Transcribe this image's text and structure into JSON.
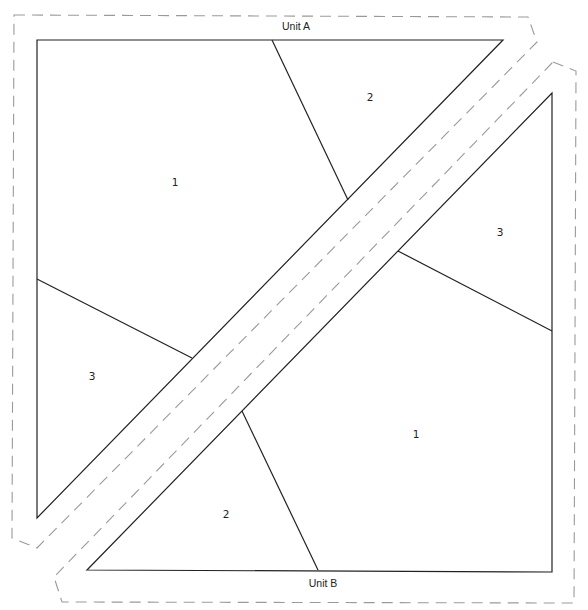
{
  "diagram": {
    "type": "foundation paper piecing pattern",
    "units": [
      {
        "name": "Unit A",
        "label_pos": [
          296,
          30
        ],
        "outline": [
          [
            37,
            40
          ],
          [
            503,
            40
          ],
          [
            37,
            518
          ]
        ],
        "seam_allowance": [
          [
            14,
            15
          ],
          [
            528,
            17
          ],
          [
            537,
            42
          ],
          [
            37,
            548
          ],
          [
            12,
            538
          ]
        ],
        "piece_lines": [
          [
            [
              272,
              40
            ],
            [
              348,
              200
            ]
          ],
          [
            [
              37,
              279
            ],
            [
              192,
              358
            ]
          ]
        ],
        "pieces": [
          {
            "number": "1",
            "pos": [
              175,
              185
            ]
          },
          {
            "number": "2",
            "pos": [
              370,
              100
            ]
          },
          {
            "number": "3",
            "pos": [
              92,
              379
            ]
          }
        ]
      },
      {
        "name": "Unit B",
        "label_pos": [
          323,
          586
        ],
        "outline": [
          [
            552,
            93
          ],
          [
            552,
            572
          ],
          [
            87,
            570
          ]
        ],
        "seam_allowance": [
          [
            553,
            62
          ],
          [
            576,
            71
          ],
          [
            574,
            603
          ],
          [
            62,
            602
          ],
          [
            54,
            577
          ]
        ],
        "piece_lines": [
          [
            [
              398,
              251
            ],
            [
              552,
              331
            ]
          ],
          [
            [
              242,
              411
            ],
            [
              318,
              570
            ]
          ]
        ],
        "pieces": [
          {
            "number": "3",
            "pos": [
              500,
              235
            ]
          },
          {
            "number": "1",
            "pos": [
              416,
              437
            ]
          },
          {
            "number": "2",
            "pos": [
              226,
              517
            ]
          }
        ]
      }
    ],
    "colors": {
      "line": "#222222",
      "seam_dash": "#9a9a9a",
      "background": "#ffffff"
    }
  }
}
